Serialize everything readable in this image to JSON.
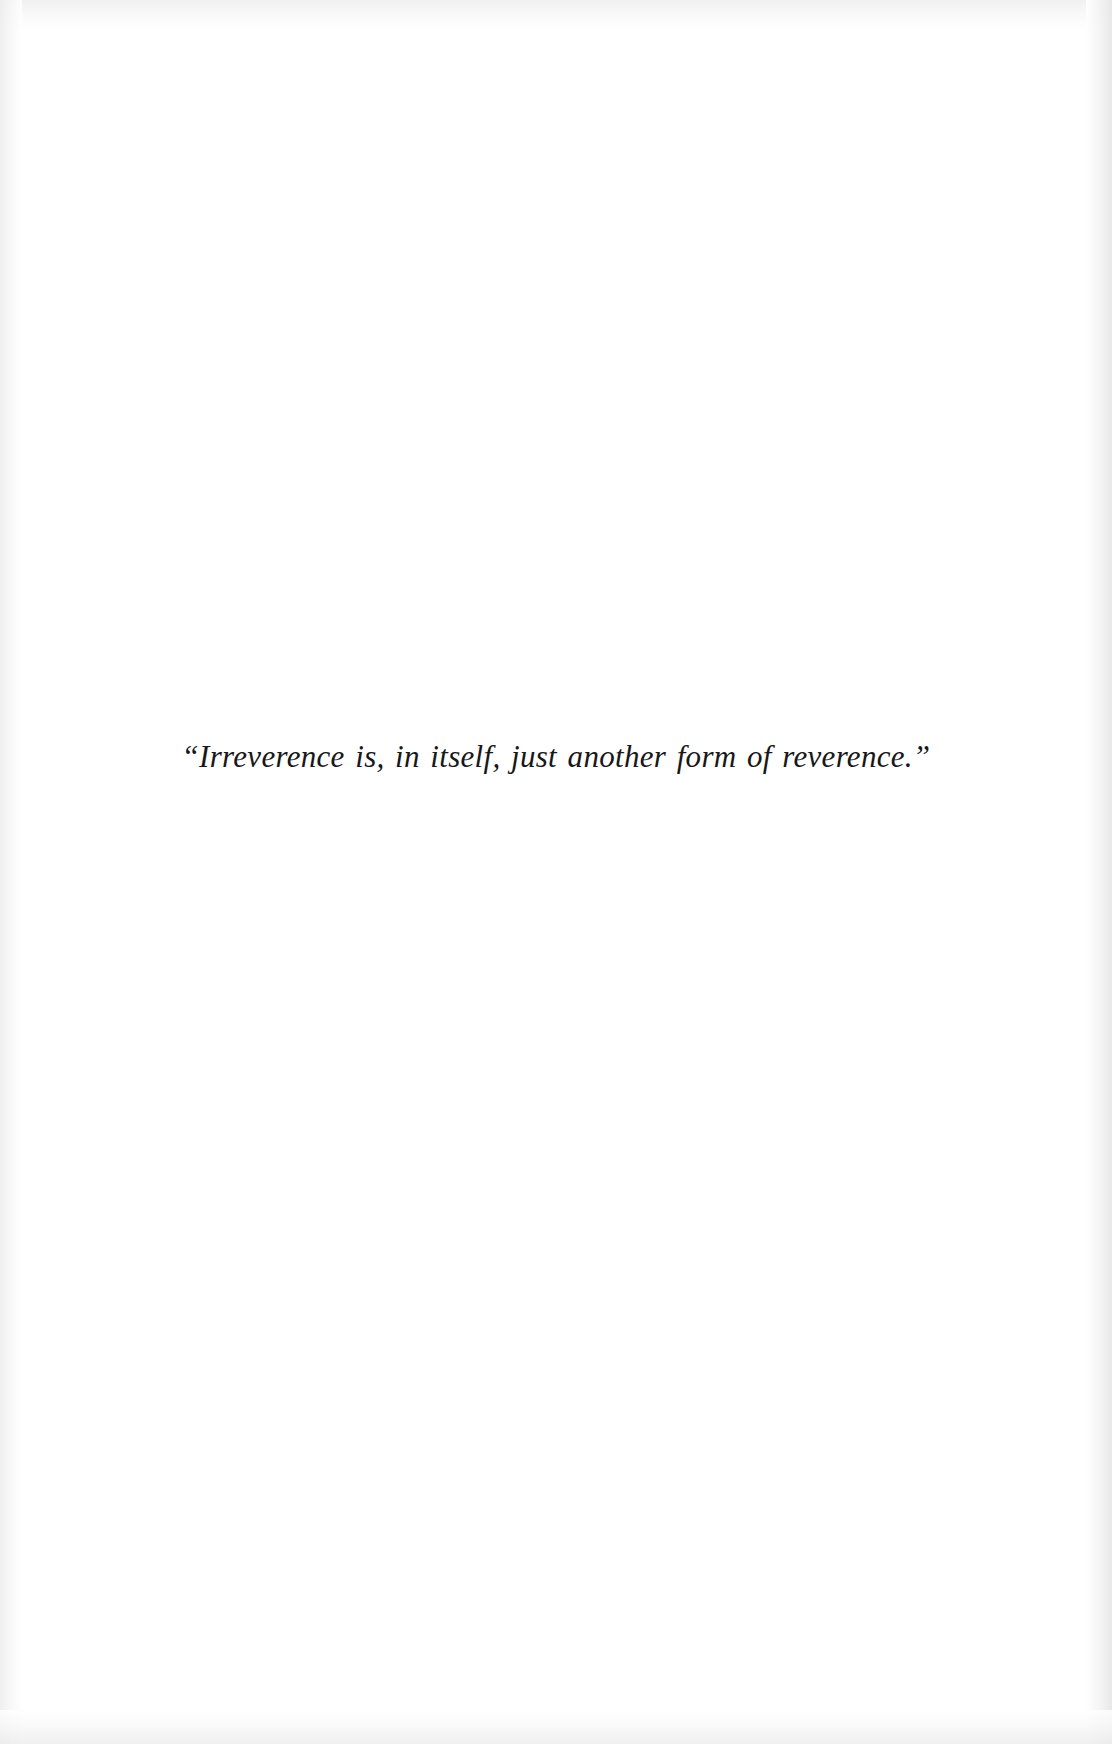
{
  "page": {
    "kind": "book-epigraph-page",
    "background_color": "#ffffff",
    "ink_color": "#181818",
    "width": 1112,
    "height": 1744
  },
  "epigraph": {
    "quote": "“Irreverence is, in itself, just another form of reverence.”",
    "opening_quote_mark": "“",
    "closing_quote_mark": "”",
    "quote_body": "Irreverence is, in itself, just another form of reverence.",
    "alignment": "center",
    "style": "italic-oldstyle-serif"
  },
  "header": {
    "running_head": ""
  },
  "footer": {
    "page_number": ""
  }
}
